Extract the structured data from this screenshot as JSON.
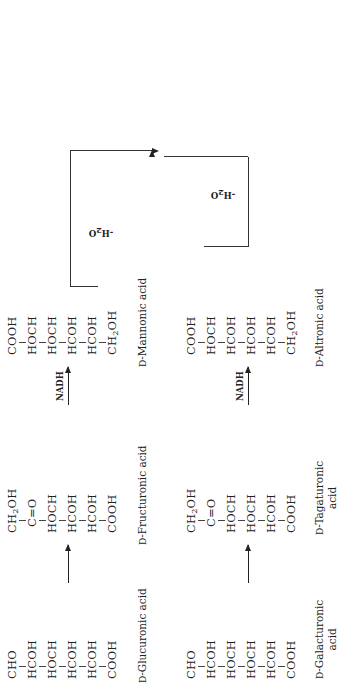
{
  "figure": {
    "orientation": "rotated 90 degrees counter-clockwise",
    "top_pathway": {
      "glucuronic": {
        "atoms": [
          "CHO",
          "HCOH",
          "HOCH",
          "HCOH",
          "HCOH",
          "COOH"
        ],
        "name_prefix": "D",
        "name": "-Glucuronic acid"
      },
      "fructuronic": {
        "atoms": [
          "CH2OH",
          "C=O",
          "HOCH",
          "HCOH",
          "HCOH",
          "COOH"
        ],
        "name_prefix": "D",
        "name": "-Fructuronic acid"
      },
      "mannonic": {
        "atoms": [
          "COOH",
          "HOCH",
          "HOCH",
          "HCOH",
          "HCOH",
          "CH2OH"
        ],
        "name_prefix": "D",
        "name": "-Mannonic acid"
      },
      "arrow2_label": "NADH",
      "dehydration_label": "-H2O"
    },
    "bottom_pathway": {
      "galacturonic": {
        "atoms": [
          "CHO",
          "HCOH",
          "HOCH",
          "HOCH",
          "HCOH",
          "COOH"
        ],
        "name_prefix": "D",
        "name_line1": "-Galacturonic",
        "name_line2": "acid"
      },
      "tagaturonic": {
        "atoms": [
          "CH2OH",
          "C=O",
          "HOCH",
          "HOCH",
          "HCOH",
          "COOH"
        ],
        "name_prefix": "D",
        "name_line1": "-Tagaturonic",
        "name_line2": "acid"
      },
      "altronic": {
        "atoms": [
          "COOH",
          "HOCH",
          "HCOH",
          "HCOH",
          "HCOH",
          "CH2OH"
        ],
        "name_prefix": "D",
        "name": "-Altronic acid"
      },
      "arrow2_label": "NADH",
      "dehydration_label": "-H2O"
    },
    "kdg": {
      "atoms": [
        "COOH",
        "C=O",
        "CH2",
        "HCOH",
        "HCOH",
        "CH2OH"
      ],
      "name_line1": "2-Keto-3-deoxy-",
      "name_line2": "gluconic acid"
    },
    "atp_label": "+ATP",
    "kdpg": {
      "atoms": [
        "COOH",
        "C=O",
        "CH2",
        "HCOH",
        "HCOH",
        "CH2OPO3H2"
      ],
      "name_line1": "2-Keto-3-deoxy-",
      "name_line2": "6-phosphogluconic",
      "name_line3": "acid"
    },
    "pyruvic": {
      "atoms": [
        "COOH",
        "C=O",
        "CH3"
      ],
      "name": "Pyruvic acid"
    },
    "plus": "+",
    "g3p": {
      "atoms": [
        "CHO",
        "HCOH",
        "CH2OPO3H2"
      ],
      "name_line1": "Glyceraldehyde-3-",
      "name_line2": "phosphate"
    }
  }
}
